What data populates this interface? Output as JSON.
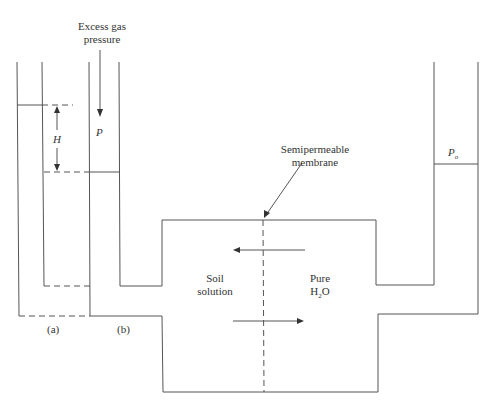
{
  "labels": {
    "excess_gas": "Excess gas",
    "pressure": "pressure",
    "P": "P",
    "H": "H",
    "Po_main": "P",
    "Po_sub": "o",
    "membrane_line1": "Semipermeable",
    "membrane_line2": "membrane",
    "soil_line1": "Soil",
    "soil_line2": "solution",
    "pure_line1": "Pure",
    "pure_h": "H",
    "pure_sub": "2",
    "pure_o": "O",
    "a": "(a)",
    "b": "(b)"
  },
  "colors": {
    "line": "#555555",
    "background": "#ffffff"
  }
}
